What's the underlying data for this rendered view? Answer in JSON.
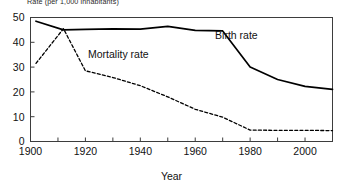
{
  "chart_data": {
    "type": "line",
    "title": "",
    "ylabel": "Rate (per 1,000 inhabitants)",
    "xlabel": "Year",
    "xlim": [
      1900,
      2010
    ],
    "ylim": [
      0,
      50
    ],
    "xticks": [
      1900,
      1910,
      1920,
      1930,
      1940,
      1950,
      1960,
      1970,
      1980,
      1990,
      2000,
      2010
    ],
    "xtick_labels": [
      "1900",
      "",
      "1920",
      "",
      "1940",
      "",
      "1960",
      "",
      "1980",
      "",
      "2000",
      ""
    ],
    "yticks": [
      0,
      10,
      20,
      30,
      40,
      50
    ],
    "ytick_labels": [
      "0",
      "10",
      "20",
      "30",
      "40",
      "50"
    ],
    "grid": false,
    "legend": "inline-annotations",
    "series": [
      {
        "name": "Birth rate",
        "style": "solid",
        "color": "#000000",
        "x": [
          1902,
          1912,
          1920,
          1930,
          1940,
          1950,
          1960,
          1970,
          1980,
          1990,
          2000,
          2010
        ],
        "values": [
          48.5,
          45.0,
          45.2,
          45.4,
          45.3,
          46.4,
          44.8,
          44.6,
          30.0,
          25.0,
          22.2,
          21.0
        ]
      },
      {
        "name": "Mortality rate",
        "style": "dashed",
        "color": "#000000",
        "x": [
          1902,
          1912,
          1920,
          1930,
          1940,
          1950,
          1960,
          1970,
          1980,
          1990,
          2000,
          2010
        ],
        "values": [
          31.5,
          45.5,
          28.5,
          25.8,
          22.5,
          18.0,
          13.0,
          9.8,
          4.6,
          4.5,
          4.5,
          4.4
        ]
      }
    ],
    "annotations": [
      {
        "text": "Birth rate",
        "x": 1975,
        "y": 41.5
      },
      {
        "text": "Mortality rate",
        "x": 1932,
        "y": 33.5
      }
    ]
  }
}
